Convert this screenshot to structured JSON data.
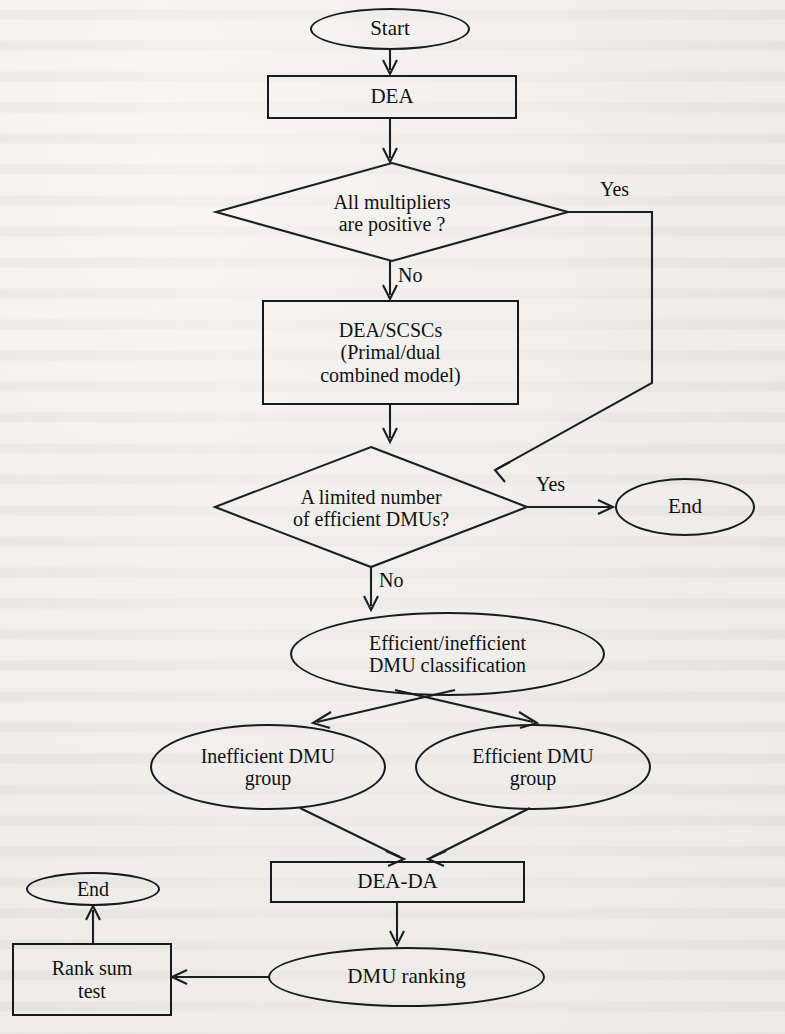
{
  "diagram": {
    "type": "flowchart",
    "colors": {
      "ink": "#1a1a1a",
      "paper": "#f2f1ef"
    },
    "nodes": {
      "start": {
        "label": "Start",
        "shape": "ellipse"
      },
      "dea": {
        "label": "DEA",
        "shape": "rectangle"
      },
      "multipliers": {
        "line1": "All multipliers",
        "line2": "are positive ?",
        "shape": "diamond"
      },
      "scscs": {
        "line1": "DEA/SCSCs",
        "line2": "(Primal/dual",
        "line3": "combined model)",
        "shape": "rectangle"
      },
      "limited": {
        "line1": "A limited number",
        "line2": "of efficient DMUs?",
        "shape": "diamond"
      },
      "end_right": {
        "label": "End",
        "shape": "ellipse"
      },
      "classification": {
        "line1": "Efficient/inefficient",
        "line2": "DMU classification",
        "shape": "ellipse"
      },
      "inefficient_group": {
        "line1": "Inefficient DMU",
        "line2": "group",
        "shape": "ellipse"
      },
      "efficient_group": {
        "line1": "Efficient DMU",
        "line2": "group",
        "shape": "ellipse"
      },
      "dea_da": {
        "label": "DEA-DA",
        "shape": "rectangle"
      },
      "dmu_ranking": {
        "label": "DMU ranking",
        "shape": "ellipse"
      },
      "rank_sum_test": {
        "line1": "Rank sum",
        "line2": "test",
        "shape": "rectangle"
      },
      "end_left": {
        "label": "End",
        "shape": "ellipse"
      }
    },
    "edge_labels": {
      "multipliers_yes": "Yes",
      "multipliers_no": "No",
      "limited_yes": "Yes",
      "limited_no": "No"
    }
  }
}
